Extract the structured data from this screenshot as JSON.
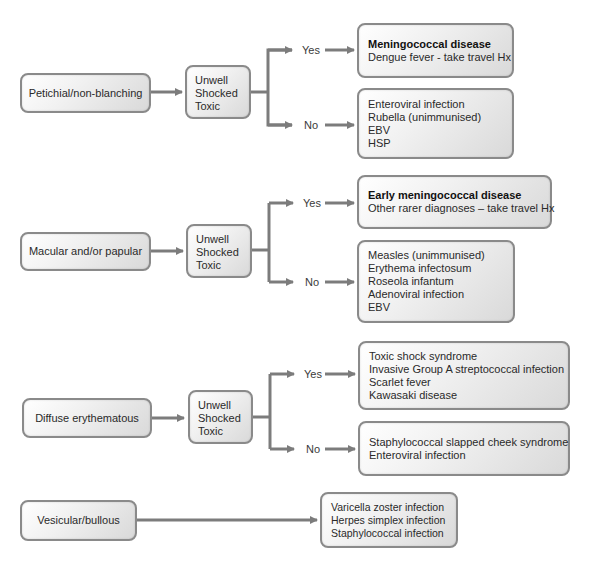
{
  "colors": {
    "arrow": "#7c7c7c",
    "border": "#8a8a8a",
    "box_fill_light": "#ffffff",
    "box_fill_dark": "#d9d9d9"
  },
  "branch_labels": {
    "yes": "Yes",
    "no": "No"
  },
  "sections": [
    {
      "rash_type": "Petichial/non-blanching",
      "condition": [
        "Unwell",
        "Shocked",
        "Toxic"
      ],
      "yes": {
        "bold": "Meningococcal disease",
        "items": [
          "Dengue fever - take travel Hx"
        ]
      },
      "no": {
        "items": [
          "Enteroviral infection",
          "Rubella (unimmunised)",
          "EBV",
          "HSP"
        ]
      }
    },
    {
      "rash_type": "Macular and/or papular",
      "condition": [
        "Unwell",
        "Shocked",
        "Toxic"
      ],
      "yes": {
        "bold": "Early meningococcal disease",
        "items": [
          "Other rarer diagnoses – take travel Hx"
        ]
      },
      "no": {
        "items": [
          "Measles  (unimmunised)",
          "Erythema infectosum",
          "Roseola infantum",
          "Adenoviral infection",
          "EBV"
        ]
      }
    },
    {
      "rash_type": "Diffuse erythematous",
      "condition": [
        "Unwell",
        "Shocked",
        "Toxic"
      ],
      "yes": {
        "items": [
          "Toxic shock syndrome",
          "Invasive Group A streptococcal infection",
          "Scarlet fever",
          "Kawasaki disease"
        ]
      },
      "no": {
        "items": [
          "Staphylococcal slapped cheek syndrome",
          "Enteroviral infection"
        ]
      }
    },
    {
      "rash_type": "Vesicular/bullous",
      "direct": {
        "items": [
          "Varicella zoster infection",
          "Herpes simplex infection",
          "Staphylococcal infection"
        ]
      }
    }
  ]
}
